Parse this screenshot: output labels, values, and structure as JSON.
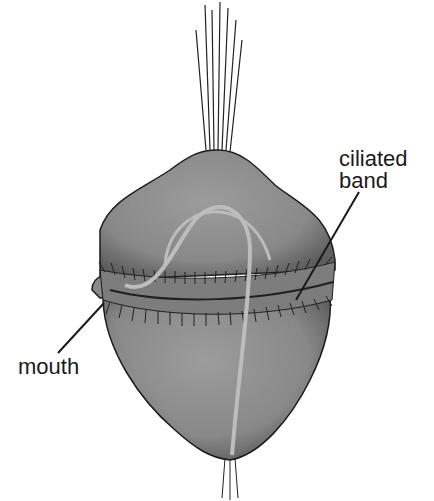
{
  "diagram": {
    "labels": {
      "ciliated_band": "ciliated\nband",
      "ciliated_band_line1": "ciliated",
      "ciliated_band_line2": "band",
      "mouth": "mouth"
    },
    "colors": {
      "body_fill": "#8f8f8f",
      "body_shade": "#5e5e5e",
      "outline": "#1a1a1a",
      "gut": "#bdbdbd",
      "background": "#ffffff"
    }
  }
}
